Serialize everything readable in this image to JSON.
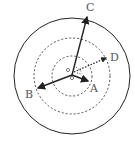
{
  "diagram": {
    "title": "",
    "labels": {
      "a": "A",
      "b": "B",
      "c": "C",
      "d": "D"
    },
    "colors": {
      "stroke": "#222222",
      "label": "#555555",
      "background": "#ffffff"
    },
    "circles": [
      {
        "role": "outer",
        "style": "solid",
        "radius": 58
      },
      {
        "role": "middle",
        "style": "dashed",
        "radius": 38
      },
      {
        "role": "inner",
        "style": "dashed",
        "radius": 20
      }
    ],
    "vectors": [
      {
        "label": "C",
        "style": "solid"
      },
      {
        "label": "B",
        "style": "solid"
      },
      {
        "label": "A",
        "style": "solid"
      },
      {
        "label": "D",
        "style": "dotted"
      }
    ]
  }
}
